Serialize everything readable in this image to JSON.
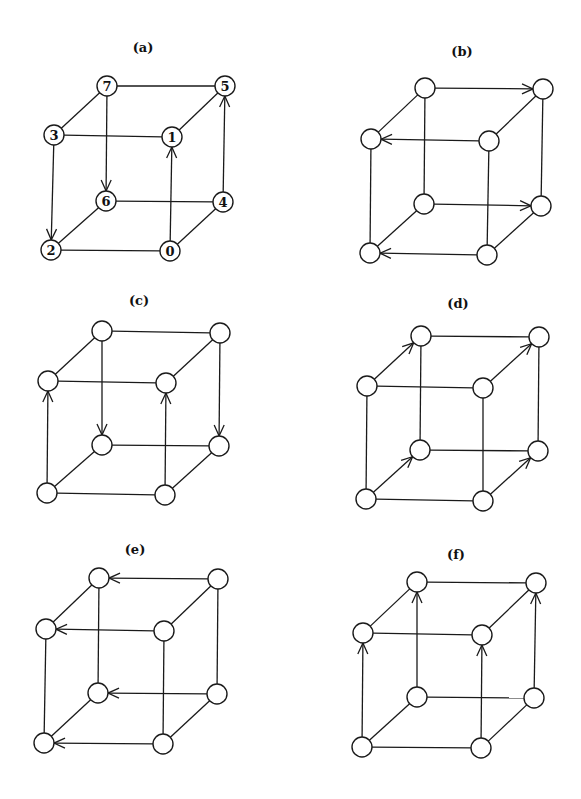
{
  "figure": {
    "node_radius": 10,
    "stroke_color": "#1a1a1a",
    "background": "#ffffff",
    "corner_order": [
      "TBL",
      "TBR",
      "TFL",
      "TFR",
      "BBL",
      "BBR",
      "BFL",
      "BFR"
    ],
    "cube_edges": [
      [
        "TBL",
        "TBR"
      ],
      [
        "TFL",
        "TFR"
      ],
      [
        "BBL",
        "BBR"
      ],
      [
        "BFL",
        "BFR"
      ],
      [
        "TBL",
        "TFL"
      ],
      [
        "TBR",
        "TFR"
      ],
      [
        "BBL",
        "BFL"
      ],
      [
        "BBR",
        "BFR"
      ],
      [
        "TBL",
        "BBL"
      ],
      [
        "TBR",
        "BBR"
      ],
      [
        "TFL",
        "BFL"
      ],
      [
        "TFR",
        "BFR"
      ]
    ],
    "panels": [
      {
        "id": "a",
        "label": "(a)",
        "label_pos": [
          143,
          52
        ],
        "nodes": {
          "TBL": {
            "pos": [
              107,
              86
            ],
            "text": "7"
          },
          "TBR": {
            "pos": [
              225,
              86
            ],
            "text": "5"
          },
          "TFL": {
            "pos": [
              54,
              135
            ],
            "text": "3"
          },
          "TFR": {
            "pos": [
              172,
              137
            ],
            "text": "1"
          },
          "BBL": {
            "pos": [
              106,
              201
            ],
            "text": "6"
          },
          "BBR": {
            "pos": [
              223,
              202
            ],
            "text": "4"
          },
          "BFL": {
            "pos": [
              51,
              250
            ],
            "text": "2"
          },
          "BFR": {
            "pos": [
              170,
              251
            ],
            "text": "0"
          }
        },
        "arrows": [
          [
            "TBL",
            "BBL"
          ],
          [
            "TFL",
            "BFL"
          ],
          [
            "BFR",
            "TFR"
          ],
          [
            "BBR",
            "TBR"
          ]
        ]
      },
      {
        "id": "b",
        "label": "(b)",
        "label_pos": [
          462,
          56
        ],
        "nodes": {
          "TBL": {
            "pos": [
              425,
              88
            ],
            "text": ""
          },
          "TBR": {
            "pos": [
              543,
              89
            ],
            "text": ""
          },
          "TFL": {
            "pos": [
              371,
              139
            ],
            "text": ""
          },
          "TFR": {
            "pos": [
              489,
              141
            ],
            "text": ""
          },
          "BBL": {
            "pos": [
              424,
              204
            ],
            "text": ""
          },
          "BBR": {
            "pos": [
              541,
              206
            ],
            "text": ""
          },
          "BFL": {
            "pos": [
              370,
              253
            ],
            "text": ""
          },
          "BFR": {
            "pos": [
              487,
              255
            ],
            "text": ""
          }
        },
        "arrows": [
          [
            "TBL",
            "TBR"
          ],
          [
            "TFR",
            "TFL"
          ],
          [
            "BBL",
            "BBR"
          ],
          [
            "BFR",
            "BFL"
          ]
        ]
      },
      {
        "id": "c",
        "label": "(c)",
        "label_pos": [
          139,
          305
        ],
        "nodes": {
          "TBL": {
            "pos": [
              102,
              331
            ],
            "text": ""
          },
          "TBR": {
            "pos": [
              220,
              333
            ],
            "text": ""
          },
          "TFL": {
            "pos": [
              48,
              381
            ],
            "text": ""
          },
          "TFR": {
            "pos": [
              166,
              383
            ],
            "text": ""
          },
          "BBL": {
            "pos": [
              102,
              445
            ],
            "text": ""
          },
          "BBR": {
            "pos": [
              219,
              446
            ],
            "text": ""
          },
          "BFL": {
            "pos": [
              47,
              493
            ],
            "text": ""
          },
          "BFR": {
            "pos": [
              165,
              495
            ],
            "text": ""
          }
        },
        "arrows": [
          [
            "TBL",
            "BBL"
          ],
          [
            "TBR",
            "BBR"
          ],
          [
            "BFL",
            "TFL"
          ],
          [
            "BFR",
            "TFR"
          ]
        ]
      },
      {
        "id": "d",
        "label": "(d)",
        "label_pos": [
          458,
          308
        ],
        "nodes": {
          "TBL": {
            "pos": [
              421,
              336
            ],
            "text": ""
          },
          "TBR": {
            "pos": [
              539,
              337
            ],
            "text": ""
          },
          "TFL": {
            "pos": [
              367,
              386
            ],
            "text": ""
          },
          "TFR": {
            "pos": [
              483,
              388
            ],
            "text": ""
          },
          "BBL": {
            "pos": [
              420,
              450
            ],
            "text": ""
          },
          "BBR": {
            "pos": [
              538,
              451
            ],
            "text": ""
          },
          "BFL": {
            "pos": [
              366,
              499
            ],
            "text": ""
          },
          "BFR": {
            "pos": [
              483,
              501
            ],
            "text": ""
          }
        },
        "arrows": [
          [
            "TFL",
            "TBL"
          ],
          [
            "TFR",
            "TBR"
          ],
          [
            "BFL",
            "BBL"
          ],
          [
            "BFR",
            "BBR"
          ]
        ]
      },
      {
        "id": "e",
        "label": "(e)",
        "label_pos": [
          135,
          554
        ],
        "nodes": {
          "TBL": {
            "pos": [
              99,
              578
            ],
            "text": ""
          },
          "TBR": {
            "pos": [
              218,
              579
            ],
            "text": ""
          },
          "TFL": {
            "pos": [
              46,
              629
            ],
            "text": ""
          },
          "TFR": {
            "pos": [
              164,
              631
            ],
            "text": ""
          },
          "BBL": {
            "pos": [
              98,
              693
            ],
            "text": ""
          },
          "BBR": {
            "pos": [
              217,
              694
            ],
            "text": ""
          },
          "BFL": {
            "pos": [
              44,
              743
            ],
            "text": ""
          },
          "BFR": {
            "pos": [
              163,
              744
            ],
            "text": ""
          }
        },
        "arrows": [
          [
            "TBR",
            "TBL"
          ],
          [
            "TFR",
            "TFL"
          ],
          [
            "BBR",
            "BBL"
          ],
          [
            "BFR",
            "BFL"
          ]
        ]
      },
      {
        "id": "f",
        "label": "(f)",
        "label_pos": [
          456,
          559
        ],
        "nodes": {
          "TBL": {
            "pos": [
              417,
              582
            ],
            "text": ""
          },
          "TBR": {
            "pos": [
              536,
              583
            ],
            "text": ""
          },
          "TFL": {
            "pos": [
              363,
              633
            ],
            "text": ""
          },
          "TFR": {
            "pos": [
              482,
              635
            ],
            "text": ""
          },
          "BBL": {
            "pos": [
              417,
              697
            ],
            "text": ""
          },
          "BBR": {
            "pos": [
              534,
              698
            ],
            "text": ""
          },
          "BFL": {
            "pos": [
              362,
              747
            ],
            "text": ""
          },
          "BFR": {
            "pos": [
              481,
              748
            ],
            "text": ""
          }
        },
        "arrows": [
          [
            "BFL",
            "TFL"
          ],
          [
            "BBL",
            "TBL"
          ],
          [
            "BFR",
            "TFR"
          ],
          [
            "BBR",
            "TBR"
          ]
        ]
      }
    ]
  }
}
